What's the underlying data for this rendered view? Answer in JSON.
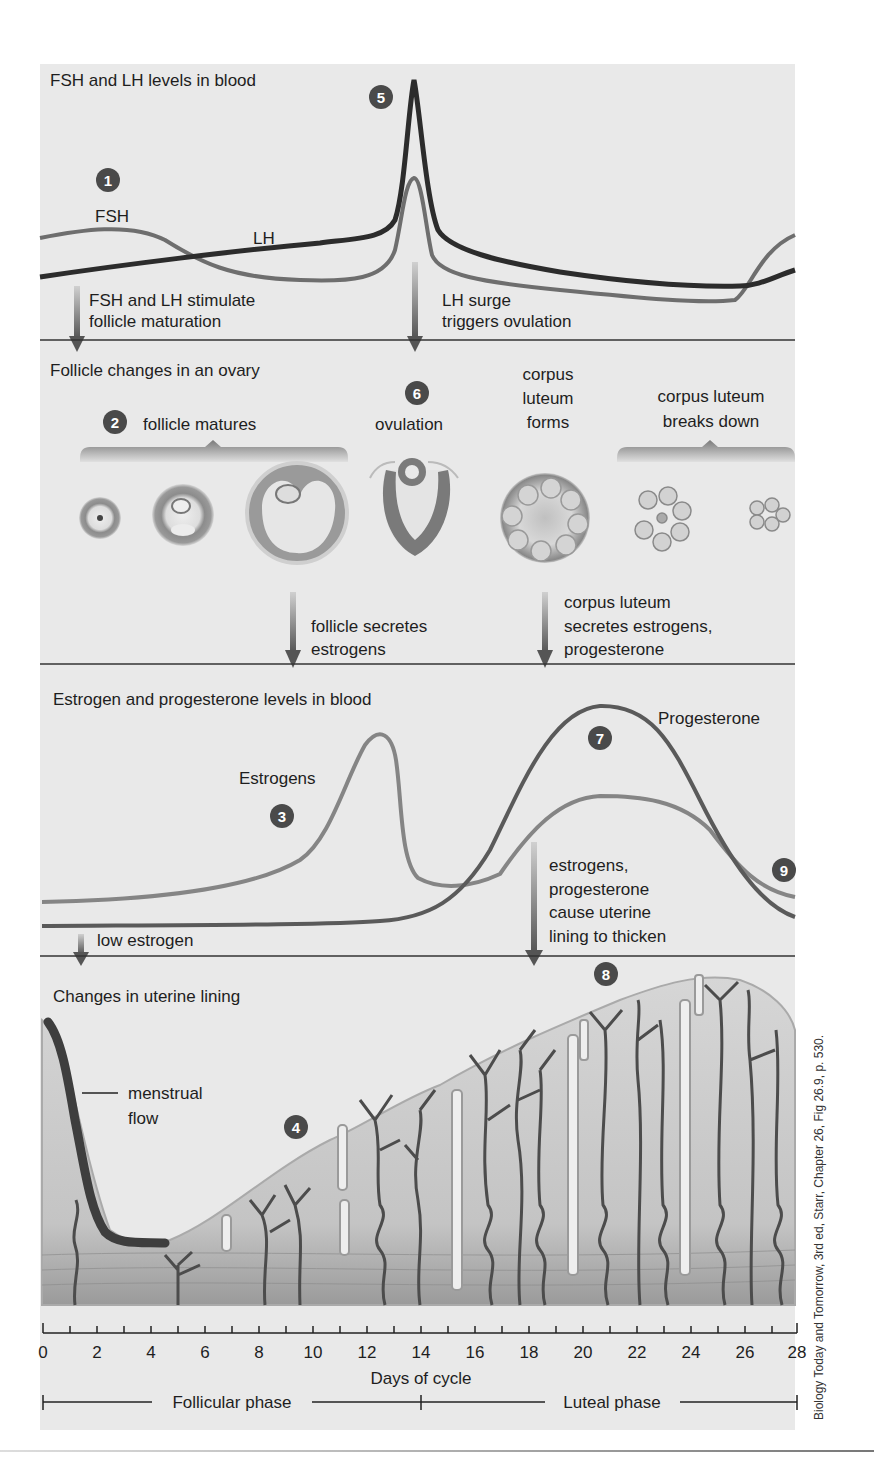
{
  "sections": {
    "fsh_lh": {
      "title": "FSH and LH levels in blood",
      "fsh_label": "FSH",
      "lh_label": "LH",
      "arrow_left_line1": "FSH and LH stimulate",
      "arrow_left_line2": "follicle maturation",
      "arrow_right_line1": "LH surge",
      "arrow_right_line2": "triggers ovulation"
    },
    "ovary": {
      "title": "Follicle changes in an ovary",
      "follicle_matures": "follicle matures",
      "ovulation": "ovulation",
      "cl_forms_1": "corpus",
      "cl_forms_2": "luteum",
      "cl_forms_3": "forms",
      "cl_breaks_1": "corpus luteum",
      "cl_breaks_2": "breaks down",
      "arrow_left_line1": "follicle secretes",
      "arrow_left_line2": "estrogens",
      "arrow_right_line1": "corpus luteum",
      "arrow_right_line2": "secretes estrogens,",
      "arrow_right_line3": "progesterone"
    },
    "hormones": {
      "title": "Estrogen and progesterone levels in blood",
      "estrogens_label": "Estrogens",
      "progesterone_label": "Progesterone",
      "low_estrogen": "low estrogen",
      "arrow_line1": "estrogens,",
      "arrow_line2": "progesterone",
      "arrow_line3": "cause uterine",
      "arrow_line4": "lining to thicken"
    },
    "uterus": {
      "title": "Changes in uterine lining",
      "menstrual_1": "menstrual",
      "menstrual_2": "flow"
    }
  },
  "markers": {
    "m1": "1",
    "m2": "2",
    "m3": "3",
    "m4": "4",
    "m5": "5",
    "m6": "6",
    "m7": "7",
    "m8": "8",
    "m9": "9"
  },
  "axis": {
    "ticks": [
      "0",
      "2",
      "4",
      "6",
      "8",
      "10",
      "12",
      "14",
      "16",
      "18",
      "20",
      "22",
      "24",
      "26",
      "28"
    ],
    "label": "Days of cycle",
    "follicular": "Follicular phase",
    "luteal": "Luteal phase"
  },
  "credit": "Biology Today and Tomorrow, 3rd ed, Starr, Chapter 26, Fig 26.9, p. 530.",
  "colors": {
    "panel": "#e9e9e9",
    "dark_curve": "#2c2c2c",
    "mid_curve": "#6e6e6e",
    "light_curve": "#8a8a8a",
    "marker": "#4a4a4a"
  }
}
